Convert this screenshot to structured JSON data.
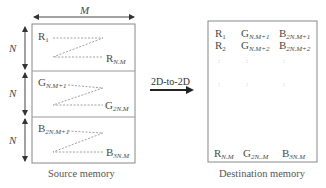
{
  "source": {
    "width_label": "M",
    "height_labels": [
      "N",
      "N",
      "N"
    ],
    "blocks": [
      {
        "channel": "R",
        "start": {
          "base": "R",
          "sub": "1"
        },
        "end": {
          "base": "R",
          "sub": "N.M"
        }
      },
      {
        "channel": "G",
        "start": {
          "base": "G",
          "sub": "N.M+1"
        },
        "end": {
          "base": "G",
          "sub": "2N.M"
        }
      },
      {
        "channel": "B",
        "start": {
          "base": "B",
          "sub": "2N.M+1"
        },
        "end": {
          "base": "B",
          "sub": "3N.M"
        }
      }
    ],
    "caption": "Source memory"
  },
  "transfer": {
    "label": "2D-to-2D"
  },
  "destination": {
    "rows": [
      [
        {
          "base": "R",
          "sub": "1"
        },
        {
          "base": "G",
          "sub": "N.M+1"
        },
        {
          "base": "B",
          "sub": "2N.M+1"
        }
      ],
      [
        {
          "base": "R",
          "sub": "2"
        },
        {
          "base": "G",
          "sub": "N.M+2"
        },
        {
          "base": "B",
          "sub": "2N.M+2"
        }
      ]
    ],
    "ellipsis": ":",
    "last_row": [
      {
        "base": "R",
        "sub": "N.M"
      },
      {
        "base": "G",
        "sub": "2N..M"
      },
      {
        "base": "B",
        "sub": "3N.M"
      }
    ],
    "caption": "Destination memory"
  },
  "colors": {
    "stroke": "#888888",
    "arrow": "#222222",
    "text": "#4a4a4a"
  }
}
